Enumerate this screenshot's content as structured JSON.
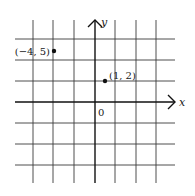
{
  "diagram": {
    "type": "coordinate-plane",
    "axes": {
      "x_label": "x",
      "y_label": "y",
      "origin_label": "0"
    },
    "grid": {
      "vertical_x": [
        33,
        53,
        74,
        115,
        136,
        156
      ],
      "horizontal_y": [
        39,
        60,
        81,
        123,
        144,
        165
      ],
      "x_range_px": [
        15,
        175
      ],
      "y_range_px": [
        20,
        183
      ],
      "color": "#3a3a3a"
    },
    "points": [
      {
        "label": "(−4, 5)",
        "coords": [
          -4,
          5
        ],
        "px": [
          54,
          51
        ]
      },
      {
        "label": "(1, 2)",
        "coords": [
          1,
          2
        ],
        "px": [
          105,
          81
        ]
      }
    ],
    "colors": {
      "axis": "#111111",
      "point": "#111111",
      "background": "#ffffff"
    }
  }
}
